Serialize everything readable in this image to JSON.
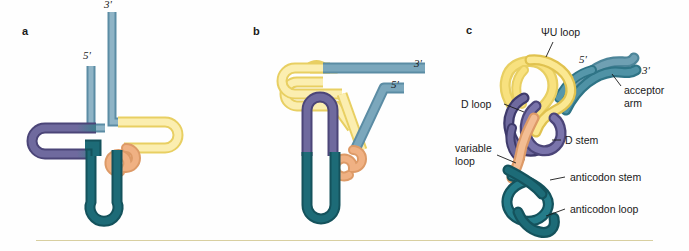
{
  "figure": {
    "background_color": "#fefefe",
    "divider_color": "#d8cfa0"
  },
  "colors": {
    "acceptor_blue": "#7ba7bc",
    "acceptor_blue_dark": "#5b8ca4",
    "teal": "#1d6b77",
    "teal_dark": "#14525c",
    "purple": "#6f6a9e",
    "purple_dark": "#4b4578",
    "yellow_pale": "#fbeeb0",
    "yellow_mid": "#f6e08a",
    "yellow_dark": "#e8cf62",
    "orange": "#f0b183",
    "orange_dark": "#dd9a67",
    "outline": "#b9a96a"
  },
  "panels": [
    {
      "letter": "a",
      "name": "cloverleaf-secondary-structure",
      "primes": [
        {
          "text": "5'",
          "name": "five-prime-label"
        },
        {
          "text": "3'",
          "name": "three-prime-label"
        }
      ]
    },
    {
      "letter": "b",
      "name": "folded-intermediate-structure",
      "primes": [
        {
          "text": "3'",
          "name": "three-prime-label"
        },
        {
          "text": "5'",
          "name": "five-prime-label"
        }
      ]
    },
    {
      "letter": "c",
      "name": "tertiary-l-shape-structure",
      "primes": [
        {
          "text": "5'",
          "name": "five-prime-label"
        },
        {
          "text": "3'",
          "name": "three-prime-label"
        }
      ],
      "annotations": [
        {
          "text": "ΨU loop",
          "name": "psi-u-loop-label"
        },
        {
          "text": "acceptor",
          "name": "acceptor-arm-label-line1"
        },
        {
          "text": "arm",
          "name": "acceptor-arm-label-line2"
        },
        {
          "text": "D loop",
          "name": "d-loop-label"
        },
        {
          "text": "D stem",
          "name": "d-stem-label"
        },
        {
          "text": "variable",
          "name": "variable-loop-label-line1"
        },
        {
          "text": "loop",
          "name": "variable-loop-label-line2"
        },
        {
          "text": "anticodon stem",
          "name": "anticodon-stem-label"
        },
        {
          "text": "anticodon loop",
          "name": "anticodon-loop-label"
        }
      ]
    }
  ]
}
